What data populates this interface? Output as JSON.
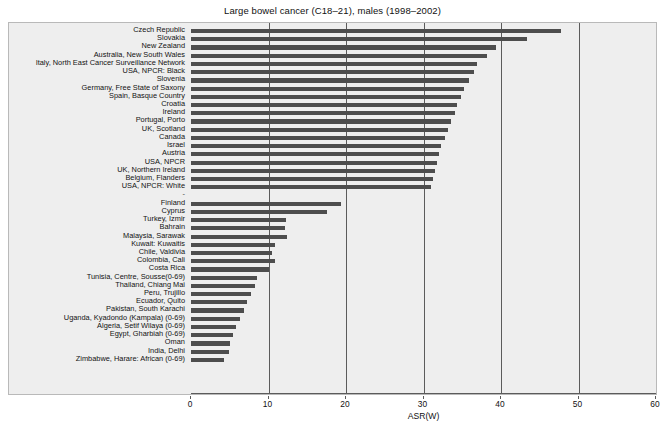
{
  "chart_data": {
    "type": "bar",
    "orientation": "horizontal",
    "title": "Large bowel cancer (C18–21), males (1998–2002)",
    "xlabel": "ASR(W)",
    "ylabel": "",
    "xlim": [
      0,
      60
    ],
    "xticks": [
      0,
      10,
      20,
      30,
      40,
      50,
      60
    ],
    "gridlines": [
      10,
      20,
      30,
      40,
      50
    ],
    "grid": true,
    "legend": null,
    "bar_color": "#4d4d4d",
    "plot_background": "#eeeeee",
    "group_separator_label": "-",
    "categories": [
      "Czech Republic",
      "Slovakia",
      "New Zealand",
      "Australia, New South Wales",
      "Italy, North East Cancer Surveillance Network",
      "USA, NPCR: Black",
      "Slovenia",
      "Germany, Free State of Saxony",
      "Spain, Basque Country",
      "Croatia",
      "Ireland",
      "Portugal, Porto",
      "UK, Scotland",
      "Canada",
      "Israel",
      "Austria",
      "USA, NPCR",
      "UK, Northern Ireland",
      "Belgium, Flanders",
      "USA, NPCR: White",
      "Finland",
      "Cyprus",
      "Turkey, Izmir",
      "Bahrain",
      "Malaysia, Sarawak",
      "Kuwait: Kuwaitis",
      "Chile, Valdivia",
      "Colombia, Cali",
      "Costa Rica",
      "Tunisia, Centre, Sousse(0-69)",
      "Thailand, Chiang Mai",
      "Peru, Trujillo",
      "Ecuador, Quito",
      "Pakistan, South Karachi",
      "Uganda, Kyadondo (Kampala) (0-69)",
      "Algeria, Setif Wilaya (0-69)",
      "Egypt, Gharbiah (0-69)",
      "Oman",
      "India, Delhi",
      "Zimbabwe, Harare: African (0-69)"
    ],
    "values": [
      47.8,
      43.3,
      39.3,
      38.2,
      36.9,
      36.5,
      35.9,
      35.2,
      34.8,
      34.3,
      34.0,
      33.6,
      33.2,
      32.8,
      32.3,
      32.0,
      31.7,
      31.5,
      31.2,
      31.0,
      19.3,
      17.6,
      12.3,
      12.1,
      12.4,
      10.8,
      10.5,
      10.8,
      10.0,
      8.5,
      8.3,
      7.8,
      7.2,
      6.8,
      6.3,
      5.8,
      5.4,
      5.0,
      4.9,
      4.3
    ],
    "separator_after_index": 19
  }
}
